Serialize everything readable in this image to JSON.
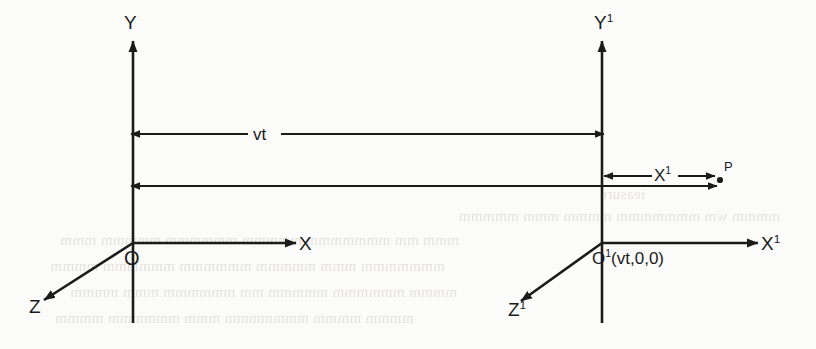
{
  "figure": {
    "kind": "coordinate-frame-diagram",
    "title_visible": false,
    "background_color": "#fbfbfa",
    "ink_color": "#1b1b1b"
  },
  "frames": [
    {
      "id": "S",
      "origin_label": "O",
      "axes": [
        {
          "name": "y-axis",
          "label": "Y",
          "direction": "up"
        },
        {
          "name": "x-axis",
          "label": "X",
          "direction": "right"
        },
        {
          "name": "z-axis",
          "label": "Z",
          "direction": "down-left"
        }
      ]
    },
    {
      "id": "S-prime",
      "origin_label": "O",
      "origin_superscript": "1",
      "origin_coords": "(vt,0,0)",
      "origin_label_full": "O¹(vt,0,0)",
      "axes": [
        {
          "name": "y-axis",
          "label": "Y",
          "superscript": "1",
          "direction": "up"
        },
        {
          "name": "x-axis",
          "label": "X",
          "superscript": "1",
          "direction": "right"
        },
        {
          "name": "z-axis",
          "label": "Z",
          "superscript": "1",
          "direction": "down-left"
        }
      ]
    }
  ],
  "measurements": [
    {
      "name": "separation-measure",
      "label": "vt",
      "arrow": "double-headed",
      "from": "O",
      "to": "O¹",
      "meaning": "displacement of the primed origin after time t"
    },
    {
      "name": "x-prime-measure",
      "label": "X",
      "superscript": "1",
      "label_full": "X¹",
      "arrow": "double-headed",
      "from": "O¹",
      "to": "P",
      "meaning": "coordinate of the event P measured in the primed frame"
    },
    {
      "name": "x-measure",
      "label": "",
      "arrow": "single-headed",
      "from": "O",
      "to": "P",
      "meaning": "coordinate of the event P measured in the unprimed frame"
    }
  ],
  "points": [
    {
      "name": "event-point",
      "label": "P",
      "marker": "dot"
    }
  ]
}
